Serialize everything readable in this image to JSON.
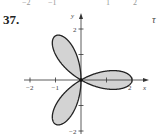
{
  "problem": {
    "number": "37.",
    "right_fragment": "τ",
    "top_fragments": [
      "−2",
      "−1",
      "1",
      "2"
    ]
  },
  "chart_data": {
    "type": "line",
    "title": "",
    "curve": "rose r = 2cos(3θ)",
    "petals": 3,
    "petal_length": 2,
    "petal_angles_deg": [
      0,
      120,
      240
    ],
    "fill_color": "#d3d3d3",
    "stroke_color": "#222222",
    "xlabel": "x",
    "ylabel": "y",
    "xlim": [
      -2.2,
      2.5
    ],
    "ylim": [
      -2.2,
      2.6
    ],
    "x_ticks": [
      -2,
      -1,
      1,
      2
    ],
    "x_tick_labels": [
      "−2",
      "−1",
      "",
      "2"
    ],
    "y_ticks": [
      -2,
      -1,
      1,
      2
    ],
    "y_tick_labels": [
      "−2",
      "",
      "",
      "2"
    ],
    "grid": false,
    "legend": null
  }
}
